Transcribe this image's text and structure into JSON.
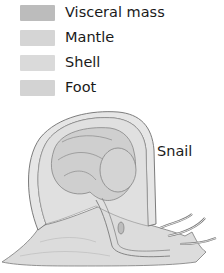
{
  "legend": {
    "items": [
      {
        "label": "Visceral mass",
        "color": "#bcbcbc",
        "top": 4
      },
      {
        "label": "Mantle",
        "color": "#d5d5d5",
        "top": 29
      },
      {
        "label": "Shell",
        "color": "#dadada",
        "top": 54
      },
      {
        "label": "Foot",
        "color": "#d3d3d3",
        "top": 79
      }
    ]
  },
  "figure": {
    "label": "Snail",
    "colors": {
      "outline": "#6e6e6e",
      "fill_light": "#ececec",
      "fill_mid": "#d8d8d8",
      "fill_dark": "#c4c4c4"
    }
  }
}
